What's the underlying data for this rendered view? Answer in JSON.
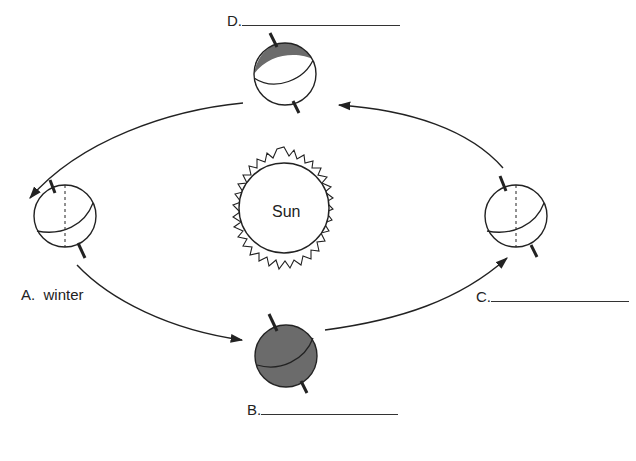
{
  "diagram": {
    "center": {
      "label": "Sun"
    },
    "positions": [
      {
        "id": "A",
        "letter": "A.",
        "answer": "winter",
        "blank": false,
        "location": "left"
      },
      {
        "id": "B",
        "letter": "B.",
        "answer": "",
        "blank": true,
        "location": "bottom"
      },
      {
        "id": "C",
        "letter": "C.",
        "answer": "",
        "blank": true,
        "location": "right"
      },
      {
        "id": "D",
        "letter": "D.",
        "answer": "",
        "blank": true,
        "location": "top"
      }
    ],
    "orbit_direction": "counterclockwise on page: D → A → B → C → D",
    "colors": {
      "line": "#222222",
      "shade": "#6b6b6b"
    }
  }
}
